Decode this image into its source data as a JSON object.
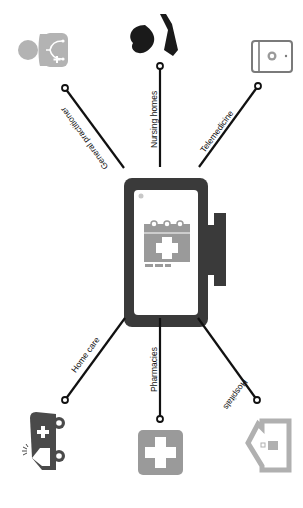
{
  "diagram": {
    "center": {
      "name": "calendar-medical-tablet",
      "icon": "calendar-cross-icon"
    },
    "colors": {
      "line": "#111111",
      "device_frame": "#3a3a3a",
      "icon_gray": "#a6a6a6",
      "icon_dark": "#4a4a4a",
      "icon_black": "#1a1a1a",
      "background": "#ffffff"
    },
    "spokes": [
      {
        "label": "General practitioner",
        "icon": "doctor-stethoscope-icon",
        "position": "top-left"
      },
      {
        "label": "Nursing homes",
        "icon": "heart-in-hand-icon",
        "position": "top"
      },
      {
        "label": "Telemedicine",
        "icon": "video-call-tablet-icon",
        "position": "top-right"
      },
      {
        "label": "Home care",
        "icon": "ambulance-icon",
        "position": "bottom-left"
      },
      {
        "label": "Pharmacies",
        "icon": "pharmacy-cross-icon",
        "position": "bottom"
      },
      {
        "label": "Hospitals",
        "icon": "hospital-building-icon",
        "position": "bottom-right"
      }
    ]
  }
}
